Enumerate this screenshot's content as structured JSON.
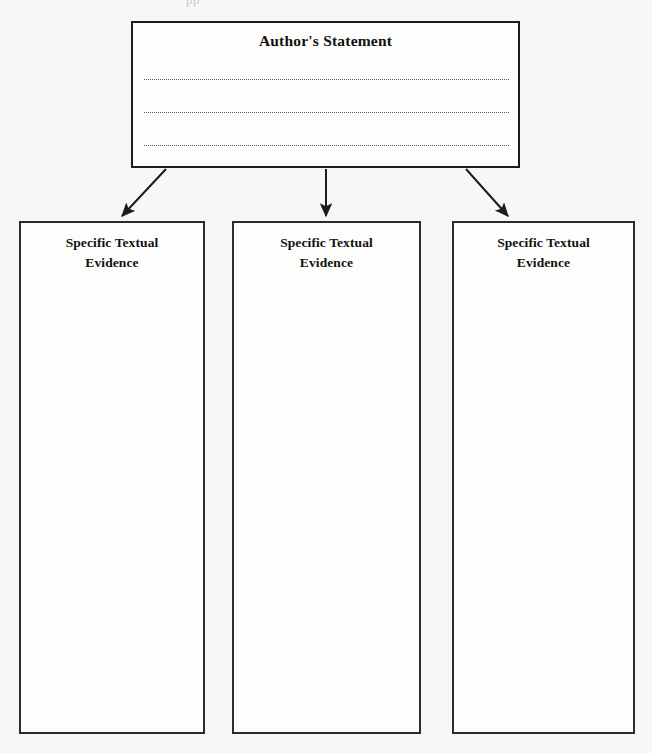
{
  "document": {
    "type": "graphic-organizer-worksheet",
    "scan_artifact_text": "pp",
    "background_color": "#f7f7f5",
    "ink_color": "#1c1c1c"
  },
  "statement": {
    "title": "Author's Statement",
    "writing_lines": 3,
    "line_style": "dotted"
  },
  "connectors": [
    {
      "name": "arrow-to-evidence-1",
      "direction": "diagonal-down-left"
    },
    {
      "name": "arrow-to-evidence-2",
      "direction": "straight-down"
    },
    {
      "name": "arrow-to-evidence-3",
      "direction": "diagonal-down-right"
    }
  ],
  "evidence_boxes": [
    {
      "label_line1": "Specific Textual",
      "label_line2": "Evidence"
    },
    {
      "label_line1": "Specific Textual",
      "label_line2": "Evidence"
    },
    {
      "label_line1": "Specific Textual",
      "label_line2": "Evidence"
    }
  ]
}
